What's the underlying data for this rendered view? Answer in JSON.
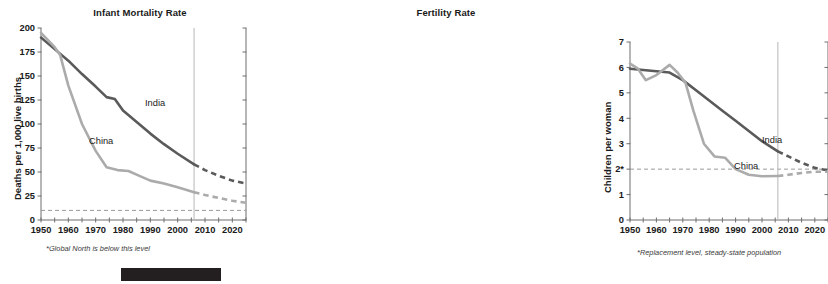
{
  "figure": {
    "panels": [
      "Infant Mortality Rate",
      "Fertility Rate"
    ],
    "colors": {
      "india": "#5a5a5a",
      "china": "#ababab",
      "axis": "#6e6e6e",
      "refline": "#9a9a9a",
      "divider": "#bdbdbd",
      "text": "#1a1a1a",
      "blackbar": "#231f20"
    }
  },
  "left_panel": {
    "title": "Infant Mortality Rate",
    "ylabel": "Deaths per 1,000 live births",
    "footnote": "*Global North is below this level",
    "india_label": "India",
    "china_label": "China",
    "refline_label": "10*"
  },
  "right_panel": {
    "title": "Fertility Rate",
    "ylabel": "Children per woman",
    "footnote": "*Replacement level, steady-state population",
    "india_label": "India",
    "china_label": "China",
    "refline_label": "2*"
  },
  "chart_data": [
    {
      "type": "line",
      "title": "Infant Mortality Rate",
      "xlabel": "",
      "ylabel": "Deaths per 1,000 live births",
      "xlim": [
        1950,
        2025
      ],
      "ylim": [
        0,
        200
      ],
      "yticks": [
        0,
        25,
        50,
        75,
        100,
        125,
        150,
        175,
        200
      ],
      "ytick_labels": [
        "0",
        "25",
        "50",
        "75",
        "100",
        "125",
        "150",
        "175",
        "200"
      ],
      "xticks": [
        1950,
        1960,
        1970,
        1980,
        1990,
        2000,
        2010,
        2020
      ],
      "xtick_labels": [
        "1950",
        "1960",
        "1970",
        "1980",
        "1990",
        "2000",
        "2010",
        "2020"
      ],
      "minor_xtick_interval": 5,
      "grid": false,
      "legend": "inline-annotations",
      "reference_line": {
        "y": 10,
        "label": "10*",
        "style": "dashed",
        "note": "Global North is below this level"
      },
      "projection_start_year": 2006,
      "projection_divider": {
        "x": 2006,
        "style": "solid-vertical",
        "color": "#bdbdbd"
      },
      "series": [
        {
          "name": "India",
          "color": "#5a5a5a",
          "observed": [
            {
              "x": 1950,
              "y": 190
            },
            {
              "x": 1955,
              "y": 178
            },
            {
              "x": 1960,
              "y": 166
            },
            {
              "x": 1965,
              "y": 152
            },
            {
              "x": 1970,
              "y": 139
            },
            {
              "x": 1974,
              "y": 128
            },
            {
              "x": 1977,
              "y": 126
            },
            {
              "x": 1980,
              "y": 114
            },
            {
              "x": 1985,
              "y": 102
            },
            {
              "x": 1990,
              "y": 90
            },
            {
              "x": 1995,
              "y": 79
            },
            {
              "x": 2000,
              "y": 69
            },
            {
              "x": 2006,
              "y": 58
            }
          ],
          "projected": [
            {
              "x": 2006,
              "y": 58
            },
            {
              "x": 2010,
              "y": 52
            },
            {
              "x": 2015,
              "y": 46
            },
            {
              "x": 2020,
              "y": 41
            },
            {
              "x": 2025,
              "y": 38
            }
          ]
        },
        {
          "name": "China",
          "color": "#ababab",
          "observed": [
            {
              "x": 1950,
              "y": 195
            },
            {
              "x": 1955,
              "y": 180
            },
            {
              "x": 1957,
              "y": 172
            },
            {
              "x": 1960,
              "y": 140
            },
            {
              "x": 1965,
              "y": 100
            },
            {
              "x": 1970,
              "y": 72
            },
            {
              "x": 1974,
              "y": 55
            },
            {
              "x": 1978,
              "y": 52
            },
            {
              "x": 1982,
              "y": 51
            },
            {
              "x": 1986,
              "y": 46
            },
            {
              "x": 1990,
              "y": 41
            },
            {
              "x": 1995,
              "y": 38
            },
            {
              "x": 2000,
              "y": 34
            },
            {
              "x": 2006,
              "y": 29
            }
          ],
          "projected": [
            {
              "x": 2006,
              "y": 29
            },
            {
              "x": 2010,
              "y": 26
            },
            {
              "x": 2015,
              "y": 23
            },
            {
              "x": 2020,
              "y": 20
            },
            {
              "x": 2025,
              "y": 18
            }
          ]
        }
      ]
    },
    {
      "type": "line",
      "title": "Fertility Rate",
      "xlabel": "",
      "ylabel": "Children per woman",
      "xlim": [
        1950,
        2025
      ],
      "ylim": [
        0,
        7
      ],
      "yticks": [
        0,
        1,
        2,
        3,
        4,
        5,
        6,
        7
      ],
      "ytick_labels": [
        "0",
        "1",
        "2*",
        "3",
        "4",
        "5",
        "6",
        "7"
      ],
      "xticks": [
        1950,
        1960,
        1970,
        1980,
        1990,
        2000,
        2010,
        2020
      ],
      "xtick_labels": [
        "1950",
        "1960",
        "1970",
        "1980",
        "1990",
        "2000",
        "2010",
        "2020"
      ],
      "minor_xtick_interval": 5,
      "grid": false,
      "legend": "inline-annotations",
      "reference_line": {
        "y": 2,
        "label": "2*",
        "style": "dashed",
        "note": "Replacement level, steady-state population"
      },
      "projection_start_year": 2006,
      "projection_divider": {
        "x": 2006,
        "style": "solid-vertical",
        "color": "#bdbdbd"
      },
      "series": [
        {
          "name": "India",
          "color": "#5a5a5a",
          "observed": [
            {
              "x": 1950,
              "y": 5.95
            },
            {
              "x": 1955,
              "y": 5.9
            },
            {
              "x": 1960,
              "y": 5.85
            },
            {
              "x": 1965,
              "y": 5.8
            },
            {
              "x": 1970,
              "y": 5.5
            },
            {
              "x": 1975,
              "y": 5.1
            },
            {
              "x": 1980,
              "y": 4.7
            },
            {
              "x": 1985,
              "y": 4.3
            },
            {
              "x": 1990,
              "y": 3.9
            },
            {
              "x": 1995,
              "y": 3.5
            },
            {
              "x": 2000,
              "y": 3.1
            },
            {
              "x": 2006,
              "y": 2.7
            }
          ],
          "projected": [
            {
              "x": 2006,
              "y": 2.7
            },
            {
              "x": 2010,
              "y": 2.5
            },
            {
              "x": 2015,
              "y": 2.25
            },
            {
              "x": 2020,
              "y": 2.05
            },
            {
              "x": 2025,
              "y": 1.95
            }
          ]
        },
        {
          "name": "China",
          "color": "#ababab",
          "observed": [
            {
              "x": 1950,
              "y": 6.15
            },
            {
              "x": 1953,
              "y": 5.95
            },
            {
              "x": 1956,
              "y": 5.5
            },
            {
              "x": 1960,
              "y": 5.7
            },
            {
              "x": 1965,
              "y": 6.1
            },
            {
              "x": 1968,
              "y": 5.8
            },
            {
              "x": 1971,
              "y": 5.4
            },
            {
              "x": 1974,
              "y": 4.3
            },
            {
              "x": 1978,
              "y": 3.0
            },
            {
              "x": 1982,
              "y": 2.5
            },
            {
              "x": 1986,
              "y": 2.45
            },
            {
              "x": 1990,
              "y": 2.0
            },
            {
              "x": 1995,
              "y": 1.78
            },
            {
              "x": 2000,
              "y": 1.72
            },
            {
              "x": 2006,
              "y": 1.73
            }
          ],
          "projected": [
            {
              "x": 2006,
              "y": 1.73
            },
            {
              "x": 2010,
              "y": 1.78
            },
            {
              "x": 2015,
              "y": 1.85
            },
            {
              "x": 2020,
              "y": 1.9
            },
            {
              "x": 2025,
              "y": 1.9
            }
          ]
        }
      ]
    }
  ]
}
